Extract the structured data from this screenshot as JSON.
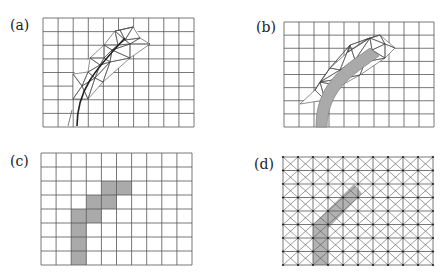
{
  "header_fragment": "...applications",
  "panels": [
    {
      "id": "a",
      "label": "(a)",
      "description": "Structured quad grid with locally refined unstructured triangular mesh along a curved crack path",
      "grid": {
        "x0": 43,
        "y0": 18,
        "x1": 194,
        "y1": 127,
        "cols": 10,
        "rows": 8
      }
    },
    {
      "id": "b",
      "label": "(b)",
      "description": "Quad grid with refined triangular mesh and shaded curved band (interface element layer)",
      "grid": {
        "x0": 284,
        "y0": 22,
        "x1": 434,
        "y1": 127,
        "cols": 10,
        "rows": 8
      }
    },
    {
      "id": "c",
      "label": "(c)",
      "description": "Regular quad grid with shaded staircase cells approximating the curved band",
      "grid": {
        "x0": 41,
        "y0": 153,
        "x1": 192,
        "y1": 265,
        "cols": 10,
        "rows": 8
      },
      "shaded_cells": [
        [
          4,
          2
        ],
        [
          5,
          2
        ],
        [
          3,
          3
        ],
        [
          4,
          3
        ],
        [
          2,
          4
        ],
        [
          3,
          4
        ],
        [
          2,
          5
        ],
        [
          2,
          6
        ],
        [
          2,
          7
        ]
      ]
    },
    {
      "id": "d",
      "label": "(d)",
      "description": "Crossed-diagonal triangulated grid with node dots and overlaid straight shaded band",
      "grid": {
        "x0": 283,
        "y0": 157,
        "x1": 433,
        "y1": 265,
        "cols": 10,
        "rows": 8
      }
    }
  ],
  "colors": {
    "grid": "#555555",
    "band": "#aaaaaa",
    "crack": "#222222",
    "background": "#ffffff"
  }
}
